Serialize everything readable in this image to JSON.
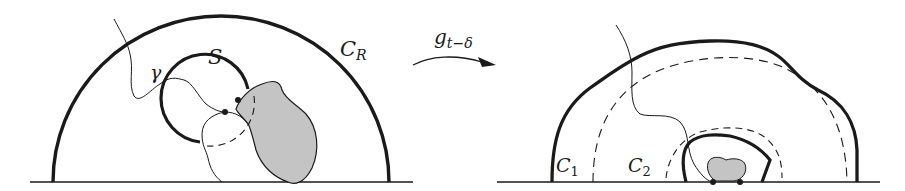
{
  "figure": {
    "left_panel": {
      "labels": {
        "outer_circle": "C",
        "outer_circle_sub": "R",
        "small_circle": "S",
        "curve": "γ"
      }
    },
    "arrow": {
      "map_label": "g",
      "map_label_sub": "t−δ"
    },
    "right_panel": {
      "labels": {
        "dashed_outer": "C",
        "dashed_outer_sub": "1",
        "dashed_inner": "C",
        "dashed_inner_sub": "2"
      }
    },
    "colors": {
      "stroke": "#1a1a1a",
      "fill_region": "#c4c4c4",
      "background": "#ffffff"
    }
  }
}
